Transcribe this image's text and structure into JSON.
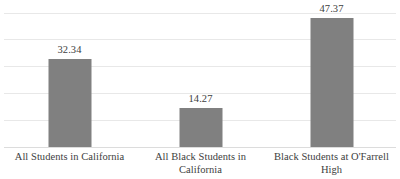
{
  "chart_data": {
    "type": "bar",
    "title": "",
    "subtitle": "",
    "xlabel": "",
    "ylabel": "",
    "categories": [
      "All Students in California",
      "All Black Students in California",
      "Black Students at O'Farrell High"
    ],
    "values": [
      32.34,
      14.27,
      47.37
    ],
    "data_labels": [
      "32.34",
      "14.27",
      "47.37"
    ],
    "ylim": [
      0,
      50
    ],
    "y_tick_values": [
      0,
      10,
      20,
      30,
      40,
      50
    ],
    "y_axis_labels_visible": false,
    "grid": true,
    "grid_orientation": "horizontal",
    "legend": false,
    "legend_position": "none",
    "bar_color": "#808080",
    "gridline_color": "#e8e8e8",
    "baseline_color": "#dcdcdc",
    "label_color": "#404040",
    "background_color": "#ffffff"
  }
}
